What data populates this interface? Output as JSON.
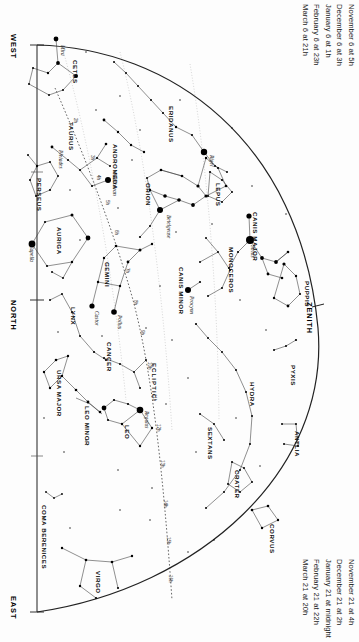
{
  "chart": {
    "type": "star-chart",
    "projection": "half-dome horizon map",
    "width": 359,
    "height": 642,
    "background_color": "#fdfdfd",
    "ink_color": "#111111"
  },
  "dates_top": {
    "lines": [
      "November 6 at   5h",
      "December 6 at   3h",
      "January 6 at    1h",
      "February 6 at 23h",
      "March 6 at 21h"
    ]
  },
  "dates_bottom": {
    "lines": [
      "November 21 at      4h",
      "December 21 at      2h",
      "January 21 at midnight",
      "February 21 at       22h",
      "March 21 at          20h"
    ]
  },
  "edge_labels": {
    "west": "WEST",
    "north": "NORTH",
    "east": "EAST",
    "zenith": "ZENITH"
  },
  "ecliptic_label": "ECLIPTIC",
  "constellations": [
    {
      "name": "CETUS",
      "x": 72,
      "y": 60
    },
    {
      "name": "TAURUS",
      "x": 68,
      "y": 122
    },
    {
      "name": "ERIDANUS",
      "x": 168,
      "y": 106
    },
    {
      "name": "PERSEUS",
      "x": 36,
      "y": 178
    },
    {
      "name": "ANDROMEDA",
      "x": 112,
      "y": 144
    },
    {
      "name": "ORION",
      "x": 145,
      "y": 183
    },
    {
      "name": "LEPUS",
      "x": 215,
      "y": 183
    },
    {
      "name": "AURIGA",
      "x": 56,
      "y": 227
    },
    {
      "name": "CANIS MAJOR",
      "x": 252,
      "y": 212
    },
    {
      "name": "MONOCEROS",
      "x": 228,
      "y": 247
    },
    {
      "name": "GEMINI",
      "x": 104,
      "y": 262
    },
    {
      "name": "CANIS MINOR",
      "x": 178,
      "y": 267
    },
    {
      "name": "PUPPIS",
      "x": 304,
      "y": 281
    },
    {
      "name": "LYNX",
      "x": 70,
      "y": 307
    },
    {
      "name": "CANCER",
      "x": 106,
      "y": 342
    },
    {
      "name": "PYXIS",
      "x": 290,
      "y": 365
    },
    {
      "name": "URSA MAJOR",
      "x": 56,
      "y": 370
    },
    {
      "name": "HYDRA",
      "x": 249,
      "y": 382
    },
    {
      "name": "LEO MINOR",
      "x": 84,
      "y": 406
    },
    {
      "name": "SEXTANS",
      "x": 207,
      "y": 427
    },
    {
      "name": "LEO",
      "x": 124,
      "y": 425
    },
    {
      "name": "ANTLIA",
      "x": 294,
      "y": 431
    },
    {
      "name": "CRATER",
      "x": 234,
      "y": 470
    },
    {
      "name": "COMA BERENICES",
      "x": 41,
      "y": 505
    },
    {
      "name": "CORVUS",
      "x": 269,
      "y": 524
    },
    {
      "name": "VIRGO",
      "x": 95,
      "y": 571
    }
  ],
  "stars_named": [
    {
      "name": "Mira",
      "x": 60,
      "y": 45,
      "mag": 3.0
    },
    {
      "name": "Pleiades",
      "x": 58,
      "y": 150,
      "mag": 2.4
    },
    {
      "name": "Aldebaran",
      "x": 112,
      "y": 173,
      "mag": 0.9
    },
    {
      "name": "Capella",
      "x": 29,
      "y": 245,
      "mag": 0.1
    },
    {
      "name": "Rigel",
      "x": 209,
      "y": 155,
      "mag": 0.1
    },
    {
      "name": "Betelgeuse",
      "x": 166,
      "y": 215,
      "mag": 0.5
    },
    {
      "name": "Sirius",
      "x": 250,
      "y": 245,
      "mag": -1.5
    },
    {
      "name": "Procyon",
      "x": 189,
      "y": 296,
      "mag": 0.4
    },
    {
      "name": "Castor",
      "x": 94,
      "y": 311,
      "mag": 1.6
    },
    {
      "name": "Pollux",
      "x": 117,
      "y": 315,
      "mag": 1.1
    },
    {
      "name": "Regulus",
      "x": 144,
      "y": 411,
      "mag": 1.4
    }
  ],
  "ra_ticks": [
    {
      "label": "2h",
      "x": 73,
      "y": 118
    },
    {
      "label": "3h",
      "x": 90,
      "y": 155
    },
    {
      "label": "4h",
      "x": 96,
      "y": 175
    },
    {
      "label": "5h",
      "x": 105,
      "y": 200
    },
    {
      "label": "6h",
      "x": 114,
      "y": 230
    },
    {
      "label": "7h",
      "x": 125,
      "y": 268
    },
    {
      "label": "8h",
      "x": 133,
      "y": 300
    },
    {
      "label": "9h",
      "x": 140,
      "y": 330
    },
    {
      "label": "10h",
      "x": 147,
      "y": 362
    },
    {
      "label": "11h",
      "x": 152,
      "y": 394
    },
    {
      "label": "12h",
      "x": 156,
      "y": 424
    },
    {
      "label": "13h",
      "x": 160,
      "y": 460
    },
    {
      "label": "14h",
      "x": 163,
      "y": 500
    },
    {
      "label": "15h",
      "x": 166,
      "y": 537
    },
    {
      "label": "16h",
      "x": 168,
      "y": 575
    }
  ]
}
